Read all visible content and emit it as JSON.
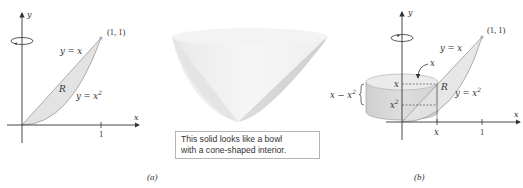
{
  "figure_a": {
    "axis_x_label": "x",
    "axis_y_label": "y",
    "tick_1": "1",
    "point_label": "(1, 1)",
    "curve_upper_label": "y = x",
    "curve_lower_base": "y = x",
    "curve_lower_exp": "2",
    "region_label": "R",
    "panel_label": "(a)",
    "rotation_icon": "rotation-arrow-icon"
  },
  "bowl": {
    "caption_line1": "This solid looks like a bowl",
    "caption_line2": "with a cone-shaped interior."
  },
  "figure_b": {
    "axis_x_label": "x",
    "axis_y_label": "y",
    "tick_x": "x",
    "tick_1": "1",
    "point_label": "(1, 1)",
    "curve_upper_label": "y = x",
    "curve_lower_base": "y = x",
    "curve_lower_exp": "2",
    "region_label": "R",
    "radius_label": "x",
    "top_height_label": "x",
    "bottom_height_base": "x",
    "bottom_height_exp": "2",
    "shell_height_base": "x − x",
    "shell_height_exp": "2",
    "panel_label": "(b)",
    "rotation_icon": "rotation-arrow-icon"
  },
  "colors": {
    "region_fill": "#e3e3e3",
    "cylinder_fill": "#d6d6d6",
    "axis": "#333333"
  }
}
